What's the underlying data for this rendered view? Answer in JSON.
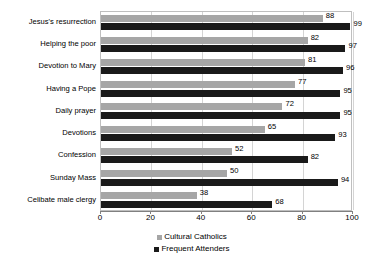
{
  "chart_data": {
    "type": "bar",
    "orientation": "horizontal",
    "title": "",
    "xlabel": "",
    "ylabel": "",
    "xlim": [
      0,
      100
    ],
    "xticks": [
      0,
      20,
      40,
      60,
      80,
      100
    ],
    "grid": true,
    "legend_position": "bottom",
    "categories": [
      "Jesus's resurrection",
      "Helping the poor",
      "Devotion to Mary",
      "Having a Pope",
      "Daily prayer",
      "Devotions",
      "Confession",
      "Sunday Mass",
      "Celibate male clergy"
    ],
    "series": [
      {
        "name": "Cultural Catholics",
        "color": "#a6a6a6",
        "values": [
          88,
          82,
          81,
          77,
          72,
          65,
          52,
          50,
          38
        ]
      },
      {
        "name": "Frequent Attenders",
        "color": "#1a1a1a",
        "values": [
          99,
          97,
          96,
          95,
          95,
          93,
          82,
          94,
          68
        ]
      }
    ]
  }
}
